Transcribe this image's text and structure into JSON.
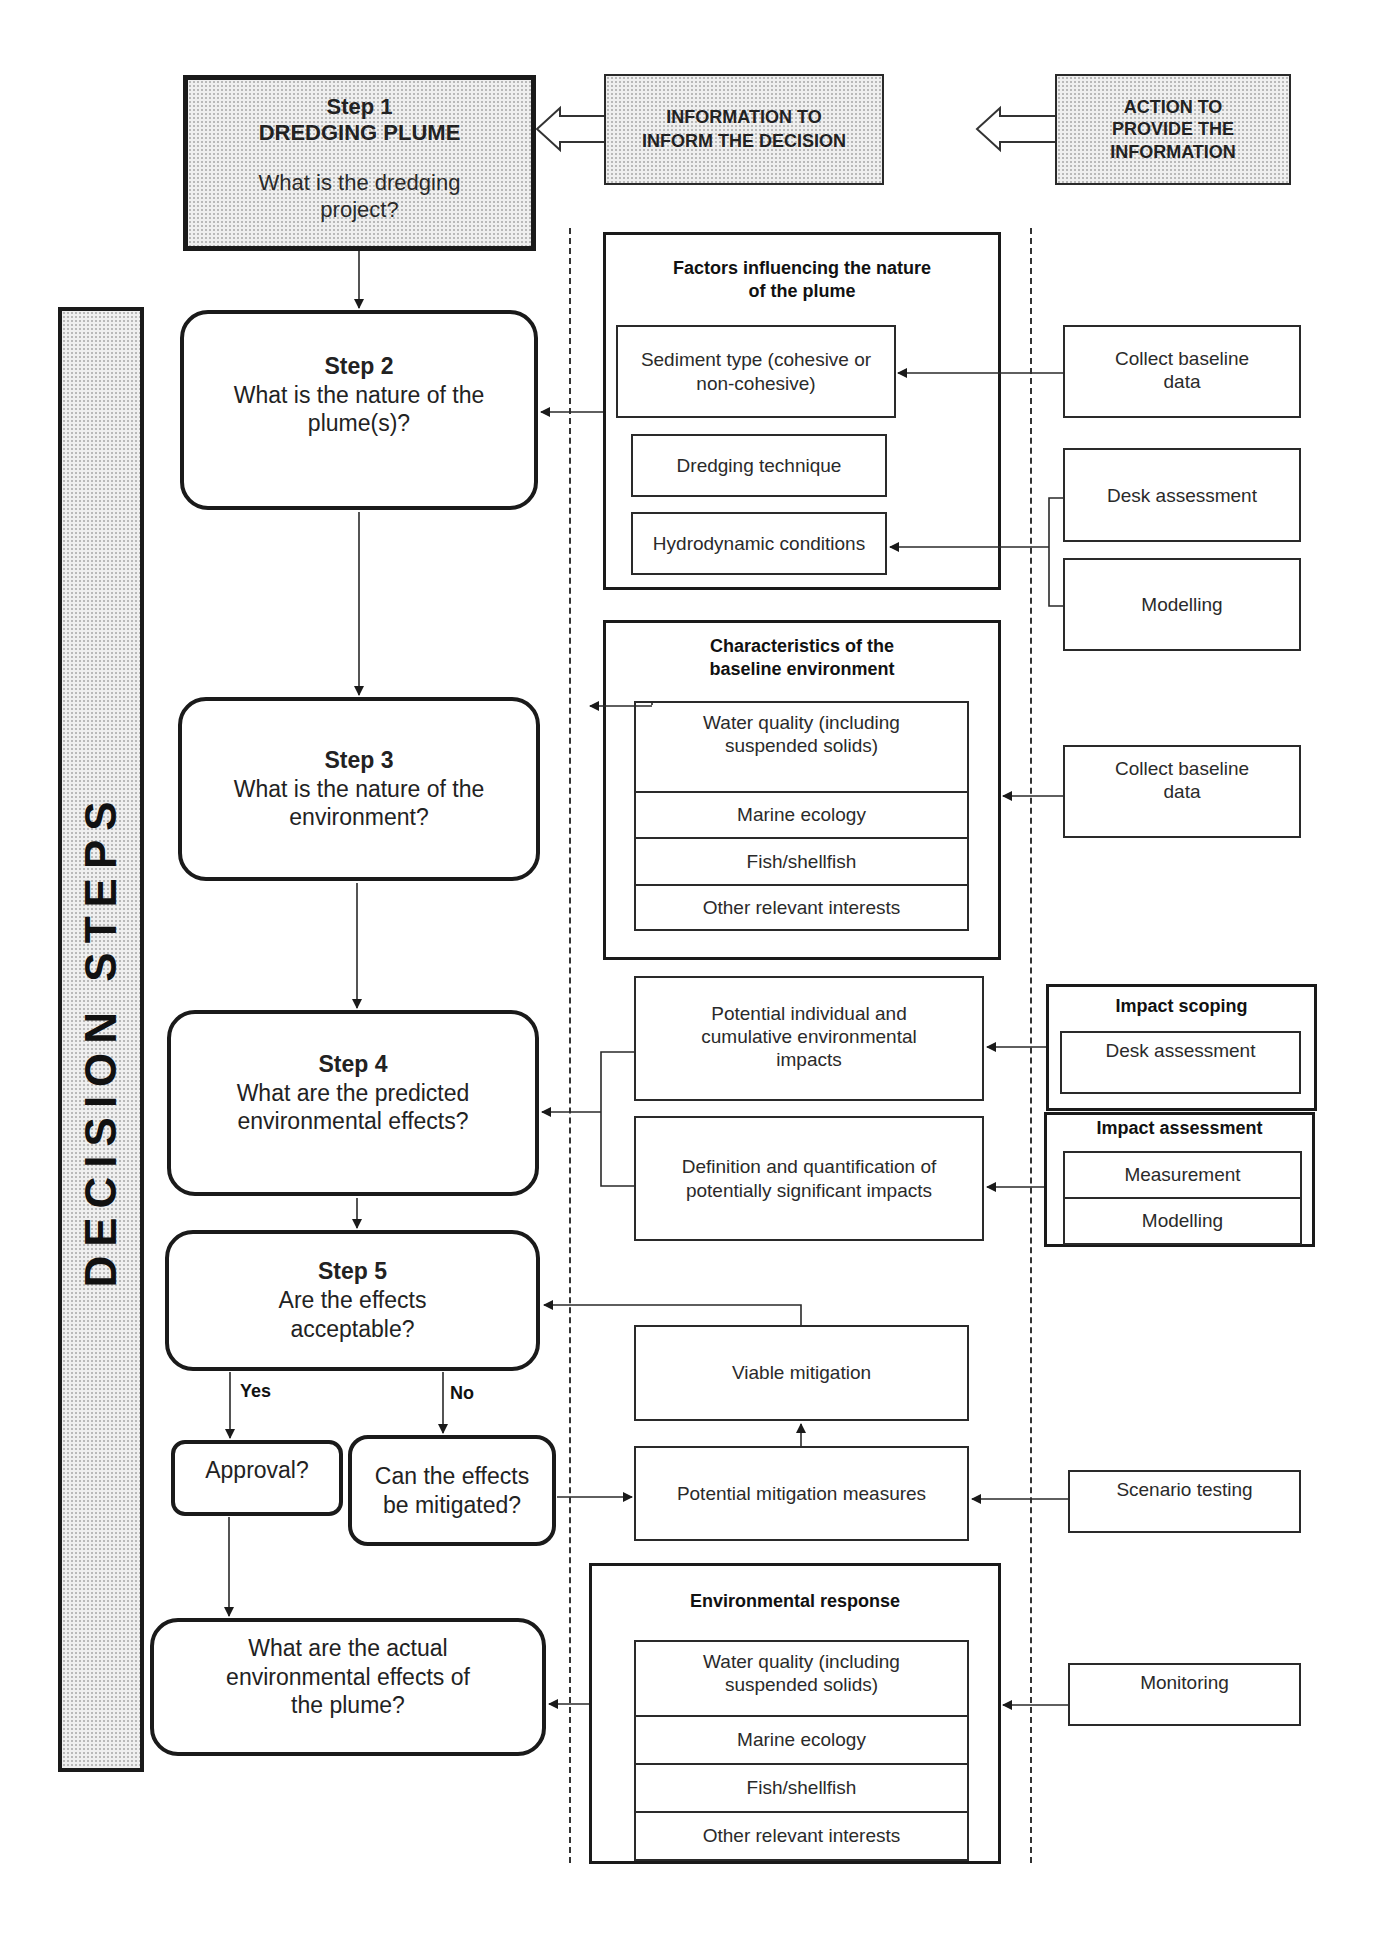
{
  "header": {
    "step1": {
      "title": "Step 1",
      "subtitle": "DREDGING PLUME",
      "question": "What is the dredging project?"
    },
    "info_column": "INFORMATION TO INFORM THE DECISION",
    "action_column": "ACTION TO PROVIDE THE INFORMATION"
  },
  "side_label": "DECISION STEPS",
  "steps": {
    "step2": {
      "title": "Step 2",
      "question": "What is the nature of the plume(s)?"
    },
    "step3": {
      "title": "Step 3",
      "question": "What is the nature of the environment?"
    },
    "step4": {
      "title": "Step 4",
      "question": "What are the predicted environmental effects?"
    },
    "step5": {
      "title": "Step 5",
      "question": "Are the effects acceptable?"
    },
    "approval": "Approval?",
    "can_mitigate": "Can the effects be mitigated?",
    "actual_effects": "What are the actual environmental effects of the plume?",
    "yes_label": "Yes",
    "no_label": "No"
  },
  "information": {
    "factors": {
      "title": "Factors influencing the nature of the plume",
      "items": [
        "Sediment type (cohesive or non-cohesive)",
        "Dredging technique",
        "Hydrodynamic conditions"
      ]
    },
    "baseline": {
      "title": "Characteristics of the baseline environment",
      "items": [
        "Water quality (including suspended solids)",
        "Marine ecology",
        "Fish/shellfish",
        "Other relevant interests"
      ]
    },
    "impacts": {
      "potential": "Potential individual and cumulative environmental impacts",
      "definition": "Definition and quantification of potentially significant impacts"
    },
    "mitigation": {
      "viable": "Viable mitigation",
      "potential": "Potential mitigation measures"
    },
    "response": {
      "title": "Environmental response",
      "items": [
        "Water quality (including suspended solids)",
        "Marine ecology",
        "Fish/shellfish",
        "Other relevant interests"
      ]
    }
  },
  "actions": {
    "collect_baseline_1": "Collect baseline data",
    "desk_assessment": "Desk assessment",
    "modelling": "Modelling",
    "collect_baseline_2": "Collect baseline data",
    "impact_scoping": {
      "title": "Impact scoping",
      "items": [
        "Desk assessment"
      ]
    },
    "impact_assessment": {
      "title": "Impact assessment",
      "items": [
        "Measurement",
        "Modelling"
      ]
    },
    "scenario_testing": "Scenario testing",
    "monitoring": "Monitoring"
  }
}
